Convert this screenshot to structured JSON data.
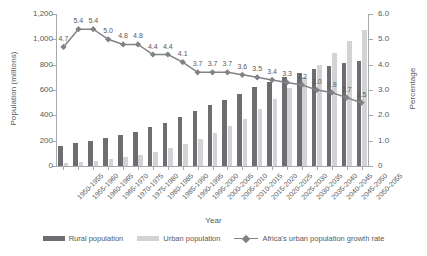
{
  "chart_data": {
    "type": "bar",
    "title": "",
    "xlabel": "Year",
    "ylabel": "Population (millions)",
    "y2label": "Percentage",
    "ylim": [
      0,
      1200
    ],
    "y2lim": [
      0,
      6.0
    ],
    "yticks": [
      "0",
      "200",
      "400",
      "600",
      "800",
      "1,000",
      "1,200"
    ],
    "y2ticks": [
      "0",
      "1.0",
      "2.0",
      "3.0",
      "4.0",
      "5.0",
      "6.0"
    ],
    "grid": false,
    "legend_position": "bottom",
    "categories": [
      "1950-1955",
      "1955-1960",
      "1960-1965",
      "1965-1970",
      "1970-1975",
      "1975-1980",
      "1980-1985",
      "1985-1990",
      "1990-1995",
      "1995-2000",
      "2000-2005",
      "2005-2010",
      "2010-2015",
      "2015-2020",
      "2020-2025",
      "2025-2030",
      "2030-2035",
      "2035-2040",
      "2040-2045",
      "2045-2050",
      "2050-2055"
    ],
    "series": [
      {
        "name": "Rural population",
        "axis": "left",
        "color": "#6d6e71",
        "values": [
          160,
          178,
          196,
          218,
          243,
          272,
          305,
          342,
          385,
          432,
          479,
          525,
          572,
          620,
          660,
          700,
          735,
          768,
          792,
          812,
          830
        ]
      },
      {
        "name": "Urban population",
        "axis": "left",
        "color": "#d1d3d4",
        "values": [
          22,
          30,
          40,
          52,
          68,
          88,
          112,
          140,
          172,
          212,
          258,
          312,
          375,
          448,
          528,
          615,
          705,
          800,
          895,
          985,
          1070
        ]
      },
      {
        "name": "Africa's urban population growth rate",
        "axis": "right",
        "color": "#808285",
        "values": [
          4.7,
          5.4,
          5.4,
          5.0,
          4.8,
          4.8,
          4.4,
          4.4,
          4.1,
          3.7,
          3.7,
          3.7,
          3.6,
          3.5,
          3.4,
          3.3,
          3.2,
          3.0,
          2.9,
          2.7,
          2.5
        ],
        "labels": [
          "4.7",
          "5.4",
          "5.4",
          "5.0",
          "4.8",
          "4.8",
          "4.4",
          "4.4",
          "4.1",
          "3.7",
          "3.7",
          "3.7",
          "3.6",
          "3.5",
          "3.4",
          "3.3",
          "3.2",
          "3.0",
          "2.9",
          "2.7",
          "2.5"
        ]
      }
    ]
  },
  "legend": {
    "rural": "Rural population",
    "urban": "Urban population",
    "rate": "Africa's urban population growth rate"
  }
}
